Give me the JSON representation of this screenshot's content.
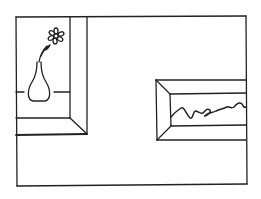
{
  "scene": {
    "description": "Line drawing of a room wall corner with two framed pictures",
    "stroke_color": "#222222",
    "background": "#ffffff"
  },
  "pictures": [
    {
      "name": "vase-with-flower-picture",
      "subject": "flower in vase"
    },
    {
      "name": "landscape-picture",
      "subject": "wavy horizon line"
    }
  ]
}
